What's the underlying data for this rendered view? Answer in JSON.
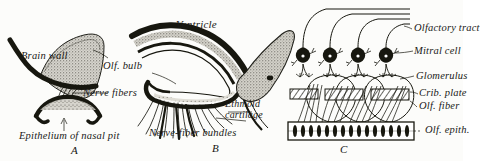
{
  "figure": {
    "style": "engraving line drawing, three panels",
    "background_color": "#fcfcfa",
    "ink_color": "#17170f"
  },
  "panels": [
    {
      "id": "A",
      "letter": "A",
      "caption": "A",
      "description": "Early embryonic stage: brain wall with nasal pit and nerve fibers",
      "labels": [
        {
          "name": "brain-wall",
          "text": "Brain wall"
        },
        {
          "name": "nerve-fibers",
          "text": "Nerve fibers"
        },
        {
          "name": "epithelium-of-nasal-pit",
          "text": "Epithelium of nasal pit"
        }
      ]
    },
    {
      "id": "B",
      "letter": "B",
      "caption": "B",
      "description": "Later stage: olfactory bulb, ventricle, ethmoid cartilage and nerve-fiber bundles",
      "labels": [
        {
          "name": "ventricle",
          "text": "Ventricle"
        },
        {
          "name": "olfactory-bulb",
          "text": "Olf. bulb"
        },
        {
          "name": "ethmoid-cartilage-line1",
          "text": "Ethmoid"
        },
        {
          "name": "ethmoid-cartilage-line2",
          "text": "cartilage"
        },
        {
          "name": "nerve-fiber-bundles",
          "text": "Nerve-fiber bundles"
        }
      ]
    },
    {
      "id": "C",
      "letter": "C",
      "caption": "C",
      "description": "Schematic of olfactory pathway: receptor cells, cribriform plate, glomeruli, mitral cells, olfactory tract",
      "labels": [
        {
          "name": "olfactory-tract",
          "text": "Olfactory tract"
        },
        {
          "name": "mitral-cell",
          "text": "Mitral cell"
        },
        {
          "name": "glomerulus",
          "text": "Glomerulus"
        },
        {
          "name": "cribriform-plate",
          "text": "Crib. plate"
        },
        {
          "name": "olfactory-fiber",
          "text": "Olf. fiber"
        },
        {
          "name": "olfactory-epithelium",
          "text": "Olf. epith."
        }
      ],
      "counts": {
        "mitral_cells": 4,
        "glomeruli": 3,
        "cribriform_plate_segments": 3,
        "tract_axons": 4,
        "receptor_cells": 15
      }
    }
  ]
}
